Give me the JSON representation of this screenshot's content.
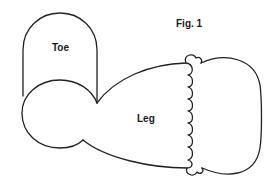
{
  "figure": {
    "title": "Fig. 1",
    "labels": {
      "toe": "Toe",
      "leg": "Leg"
    },
    "stroke_color": "#222222",
    "background": "#ffffff"
  }
}
